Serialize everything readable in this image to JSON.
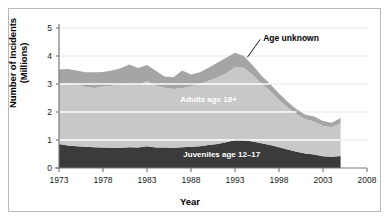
{
  "chart_data": {
    "type": "area",
    "stacked": true,
    "title": "",
    "xlabel": "Year",
    "ylabel": "Number of Incidents (Millions)",
    "xlim": [
      1973,
      2008
    ],
    "ylim": [
      0,
      5
    ],
    "xticks": [
      1973,
      1978,
      1983,
      1988,
      1993,
      1998,
      2003,
      2008
    ],
    "yticks": [
      0,
      1,
      2,
      3,
      4,
      5
    ],
    "grid": "horizontal",
    "legend": "inline-annotations",
    "x": [
      1973,
      1974,
      1975,
      1976,
      1977,
      1978,
      1979,
      1980,
      1981,
      1982,
      1983,
      1984,
      1985,
      1986,
      1987,
      1988,
      1989,
      1990,
      1991,
      1992,
      1993,
      1994,
      1995,
      1996,
      1997,
      1998,
      1999,
      2000,
      2001,
      2002,
      2003,
      2004,
      2005
    ],
    "series": [
      {
        "name": "Juveniles age 12-17",
        "color": "#3b3b3b",
        "values": [
          0.86,
          0.8,
          0.78,
          0.76,
          0.74,
          0.73,
          0.72,
          0.72,
          0.74,
          0.73,
          0.78,
          0.73,
          0.73,
          0.72,
          0.74,
          0.76,
          0.78,
          0.82,
          0.86,
          0.92,
          1.0,
          1.0,
          0.95,
          0.88,
          0.82,
          0.74,
          0.66,
          0.58,
          0.52,
          0.48,
          0.42,
          0.4,
          0.43
        ]
      },
      {
        "name": "Adults age 18+",
        "color": "#c8c8c8",
        "values": [
          2.1,
          2.22,
          2.2,
          2.14,
          2.12,
          2.18,
          2.22,
          2.26,
          2.24,
          2.22,
          2.34,
          2.22,
          2.14,
          2.1,
          2.12,
          2.16,
          2.22,
          2.3,
          2.38,
          2.46,
          2.6,
          2.58,
          2.38,
          2.14,
          1.94,
          1.7,
          1.5,
          1.34,
          1.22,
          1.18,
          1.08,
          1.06,
          1.18
        ]
      },
      {
        "name": "Age unknown",
        "color": "#a5a5a5",
        "values": [
          0.56,
          0.52,
          0.5,
          0.52,
          0.56,
          0.52,
          0.54,
          0.58,
          0.72,
          0.62,
          0.56,
          0.52,
          0.4,
          0.42,
          0.62,
          0.42,
          0.42,
          0.46,
          0.52,
          0.56,
          0.52,
          0.42,
          0.34,
          0.28,
          0.24,
          0.22,
          0.2,
          0.18,
          0.16,
          0.18,
          0.18,
          0.16,
          0.18
        ]
      }
    ],
    "totals": [
      3.52,
      3.54,
      3.48,
      3.42,
      3.42,
      3.43,
      3.48,
      3.56,
      3.7,
      3.57,
      3.68,
      3.47,
      3.27,
      3.24,
      3.48,
      3.34,
      3.42,
      3.58,
      3.76,
      3.94,
      4.12,
      4.0,
      3.67,
      3.3,
      3.0,
      2.66,
      2.36,
      2.1,
      1.9,
      1.84,
      1.68,
      1.62,
      1.79
    ],
    "annotations": [
      {
        "text": "Age unknown",
        "x": 1996.2,
        "y": 4.52,
        "leader": true
      },
      {
        "text": "Adults age 18+",
        "x": 1990.0,
        "y": 2.35,
        "inline": true
      },
      {
        "text": "Juveniles age 12-17",
        "x": 1991.5,
        "y": 0.38,
        "inline": true
      }
    ]
  },
  "axis": {
    "ylabel": "Number of Incidents (Millions)",
    "xlabel": "Year",
    "ytick_labels": [
      "5",
      "4",
      "3",
      "2",
      "1",
      "0"
    ],
    "xtick_labels": [
      "1973",
      "1978",
      "1983",
      "1988",
      "1993",
      "1998",
      "2003",
      "2008"
    ]
  },
  "labels": {
    "age_unknown": "Age unknown",
    "adults": "Adults age 18+",
    "juveniles": "Juveniles age 12–17"
  },
  "colors": {
    "juveniles": "#3b3b3b",
    "adults": "#c8c8c8",
    "age_unknown": "#a5a5a5",
    "gridline_light": "#e8e8e8",
    "gridline_white": "#ffffff",
    "axis": "#7a7a7a",
    "frame": "#b9b9b9"
  }
}
